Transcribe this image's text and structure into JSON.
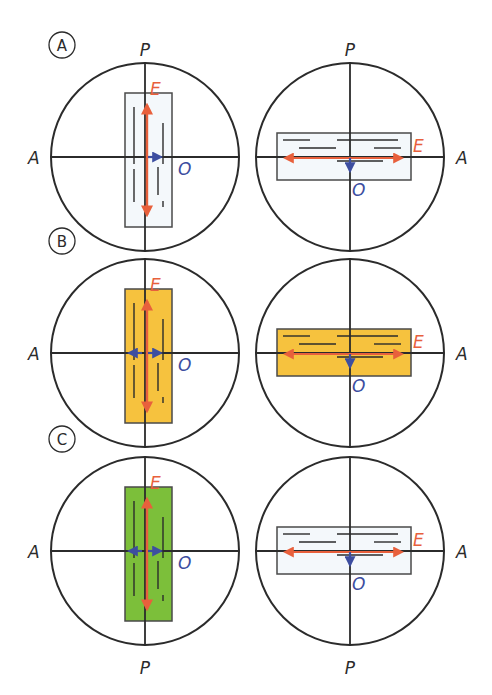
{
  "colors": {
    "outline": "#2b2b2b",
    "e_vector": "#e8603c",
    "o_vector": "#3d4ea0",
    "panel_a_fill": "#f4f8fb",
    "panel_b_fill": "#f6c23e",
    "panel_c_fill": "#7cbf3a"
  },
  "labels": {
    "polarizer": "P",
    "analyzer": "A",
    "extraordinary": "E",
    "ordinary": "O"
  },
  "rows": [
    {
      "badge": "A",
      "left": {
        "crystal_orientation": "vertical",
        "fill": "#f4f8fb"
      },
      "right": {
        "crystal_orientation": "horizontal",
        "fill": "#f4f8fb"
      },
      "top_labels": true,
      "bottom_labels": false
    },
    {
      "badge": "B",
      "left": {
        "crystal_orientation": "vertical",
        "fill": "#f6c23e"
      },
      "right": {
        "crystal_orientation": "horizontal",
        "fill": "#f6c23e"
      },
      "top_labels": false,
      "bottom_labels": false
    },
    {
      "badge": "C",
      "left": {
        "crystal_orientation": "vertical",
        "fill": "#7cbf3a"
      },
      "right": {
        "crystal_orientation": "horizontal",
        "fill": "#f4f8fb"
      },
      "top_labels": false,
      "bottom_labels": true
    }
  ]
}
